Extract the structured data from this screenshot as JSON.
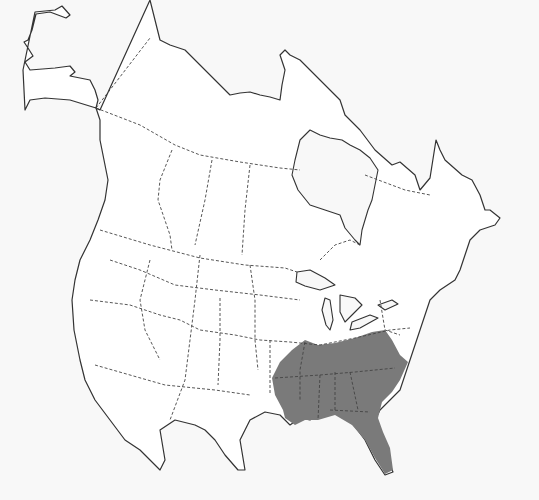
{
  "map": {
    "type": "species-range-map",
    "region": "North America",
    "background_color": "#f8f8f8",
    "land_color": "#ffffff",
    "outline_color": "#333333",
    "range": {
      "label": "",
      "color": "#7a7a7a",
      "description": "Shaded range covering southeastern United States"
    }
  }
}
